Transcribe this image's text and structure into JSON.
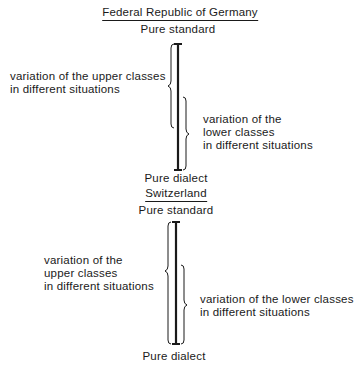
{
  "panels": [
    {
      "title": "Federal Republic of Germany",
      "top_label": "Pure standard",
      "bottom_label": "Pure dialect",
      "upper_classes_label": [
        "variation of the upper classes",
        "in different situations"
      ],
      "lower_classes_label": [
        "variation of the",
        "lower classes",
        "in different situations"
      ]
    },
    {
      "title": "Switzerland",
      "top_label": "Pure standard",
      "bottom_label": "Pure dialect",
      "upper_classes_label": [
        "variation of the",
        "upper classes",
        "in different situations"
      ],
      "lower_classes_label": [
        "variation of the lower classes",
        "in different situations"
      ]
    }
  ],
  "colors": {
    "ink": "#1a1a1a",
    "background": "#ffffff"
  }
}
